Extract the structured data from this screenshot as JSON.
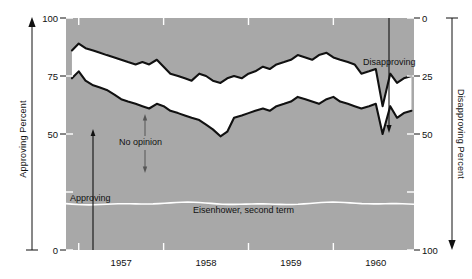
{
  "chart_data": {
    "type": "area",
    "title": "",
    "subtitle": "",
    "annotations": [
      {
        "name": "approving-label",
        "text": "Approving"
      },
      {
        "name": "no-opinion-label",
        "text": "No opinion"
      },
      {
        "name": "disapproving-label",
        "text": "Disapproving"
      },
      {
        "name": "series-caption",
        "text": "Eisenhower, second term"
      }
    ],
    "left_axis": {
      "label": "Approving Percent",
      "ticks": [
        0,
        25,
        50,
        75,
        100
      ],
      "tick_labels": [
        "0",
        "",
        "50",
        "75",
        "100"
      ],
      "visible_tick_labels": [
        "100",
        "75",
        "50",
        "0"
      ],
      "range": [
        0,
        100
      ],
      "direction": "up"
    },
    "right_axis": {
      "label": "Disapproving Percent",
      "ticks": [
        0,
        25,
        50,
        75,
        100
      ],
      "visible_tick_labels": [
        "0",
        "25",
        "50",
        "100"
      ],
      "range": [
        0,
        100
      ],
      "direction": "down"
    },
    "xlabel": "",
    "x_tick_labels": [
      "1957",
      "1958",
      "1959",
      "1960"
    ],
    "xlim": [
      1956.85,
      1960.95
    ],
    "grid": false,
    "legend": "none",
    "colors": {
      "plot_background": "#a8a8a8",
      "band_fill": "#ffffff",
      "curve": "#111111",
      "baseline_rule": "#ffffff",
      "text": "#111111",
      "page_background": "#ffffff"
    },
    "series": [
      {
        "name": "Approving",
        "note": "lower boundary of white No-opinion band; percent approving",
        "x": [
          1956.92,
          1957.0,
          1957.08,
          1957.17,
          1957.25,
          1957.33,
          1957.42,
          1957.5,
          1957.58,
          1957.67,
          1957.75,
          1957.83,
          1957.92,
          1958.0,
          1958.08,
          1958.17,
          1958.25,
          1958.33,
          1958.42,
          1958.5,
          1958.58,
          1958.67,
          1958.75,
          1958.83,
          1958.92,
          1959.0,
          1959.08,
          1959.17,
          1959.25,
          1959.33,
          1959.42,
          1959.5,
          1959.58,
          1959.67,
          1959.75,
          1959.83,
          1959.92,
          1960.0,
          1960.08,
          1960.17,
          1960.25,
          1960.33,
          1960.42,
          1960.5,
          1960.58,
          1960.67,
          1960.75,
          1960.83,
          1960.92
        ],
        "values": [
          74,
          77,
          73,
          71,
          70,
          69,
          67,
          65,
          64,
          63,
          62,
          61,
          63,
          62,
          60,
          59,
          58,
          57,
          56,
          54,
          52,
          49,
          51,
          57,
          58,
          59,
          60,
          61,
          60,
          62,
          63,
          64,
          66,
          65,
          64,
          63,
          65,
          66,
          64,
          63,
          62,
          61,
          62,
          63,
          50,
          62,
          57,
          59,
          60
        ]
      },
      {
        "name": "Approving + No opinion",
        "note": "upper boundary of white band; 100 minus percent disapproving",
        "x": [
          1956.92,
          1957.0,
          1957.08,
          1957.17,
          1957.25,
          1957.33,
          1957.42,
          1957.5,
          1957.58,
          1957.67,
          1957.75,
          1957.83,
          1957.92,
          1958.0,
          1958.08,
          1958.17,
          1958.25,
          1958.33,
          1958.42,
          1958.5,
          1958.58,
          1958.67,
          1958.75,
          1958.83,
          1958.92,
          1959.0,
          1959.08,
          1959.17,
          1959.25,
          1959.33,
          1959.42,
          1959.5,
          1959.58,
          1959.67,
          1959.75,
          1959.83,
          1959.92,
          1960.0,
          1960.08,
          1960.17,
          1960.25,
          1960.33,
          1960.42,
          1960.5,
          1960.58,
          1960.67,
          1960.75,
          1960.83,
          1960.92
        ],
        "values": [
          86,
          89,
          87,
          86,
          85,
          84,
          83,
          82,
          81,
          80,
          81,
          80,
          82,
          79,
          76,
          75,
          74,
          73,
          76,
          75,
          73,
          72,
          74,
          75,
          74,
          76,
          77,
          79,
          78,
          80,
          81,
          82,
          84,
          83,
          82,
          84,
          85,
          83,
          82,
          81,
          80,
          76,
          77,
          78,
          62,
          76,
          72,
          74,
          75
        ]
      }
    ]
  }
}
